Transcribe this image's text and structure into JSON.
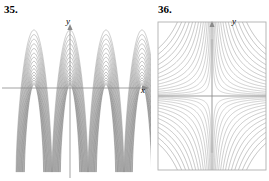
{
  "page": {
    "width": 269,
    "height": 181,
    "background": "#ffffff",
    "stroke_color": "#7a7a7a",
    "axis_color": "#8a8a8a",
    "border_color": "#b0b0b0",
    "text_color": "#000000"
  },
  "figures": [
    {
      "number": "35.",
      "axis_labels": {
        "y": "y",
        "x": "x"
      },
      "has_border": false,
      "origin": {
        "x": 70,
        "y": 88
      },
      "chart_data": {
        "type": "line",
        "title": "35.",
        "xlabel": "x",
        "ylabel": "y",
        "grid": false,
        "legend": null,
        "description": "Family of nested cycloid-like arches repeating periodically along the x-axis; each curve rises from a cusp on the lower boundary, arches over, and descends to the next cusp. Inner curves are shorter arches nested beneath the tallest outer arch.",
        "axis_ranges": {
          "xlim": [
            -2.2,
            2.2
          ],
          "ylim": [
            -1.6,
            1.35
          ]
        },
        "series": [
          {
            "name": "arch-1",
            "amplitude": 1.0
          },
          {
            "name": "arch-2",
            "amplitude": 0.92
          },
          {
            "name": "arch-3",
            "amplitude": 0.84
          },
          {
            "name": "arch-4",
            "amplitude": 0.76
          },
          {
            "name": "arch-5",
            "amplitude": 0.68
          },
          {
            "name": "arch-6",
            "amplitude": 0.6
          },
          {
            "name": "arch-7",
            "amplitude": 0.53
          },
          {
            "name": "arch-8",
            "amplitude": 0.46
          },
          {
            "name": "arch-9",
            "amplitude": 0.39
          },
          {
            "name": "arch-10",
            "amplitude": 0.33
          },
          {
            "name": "arch-11",
            "amplitude": 0.27
          },
          {
            "name": "arch-12",
            "amplitude": 0.22
          },
          {
            "name": "arch-13",
            "amplitude": 0.17
          },
          {
            "name": "arch-14",
            "amplitude": 0.13
          },
          {
            "name": "arch-15",
            "amplitude": 0.09
          },
          {
            "name": "arch-16",
            "amplitude": 0.06
          }
        ],
        "arch_centers": [
          -1.0,
          0.0,
          1.0,
          2.0
        ],
        "cusp_y": -1.45
      }
    },
    {
      "number": "36.",
      "axis_labels": {
        "y": "y",
        "x": ""
      },
      "has_border": true,
      "origin": {
        "x": 152,
        "y": 96
      },
      "chart_data": {
        "type": "line",
        "title": "36.",
        "xlabel": "",
        "ylabel": "y",
        "grid": false,
        "legend": null,
        "description": "Contour/level-curve plot of a saddle (hyperbolic) field. Four quadrants of hyperbola-like curves asymptotic to the horizontal and vertical axes, nested toward the center in each quadrant, bounded by a rectangular frame.",
        "axis_ranges": {
          "xlim": [
            -2.0,
            2.0
          ],
          "ylim": [
            -2.0,
            2.0
          ]
        },
        "level_values": [
          0.04,
          0.09,
          0.16,
          0.25,
          0.36,
          0.49,
          0.64,
          0.81,
          1.0,
          1.21,
          1.44,
          1.69,
          1.96,
          2.25,
          2.56
        ],
        "quadrants": 4
      }
    }
  ]
}
